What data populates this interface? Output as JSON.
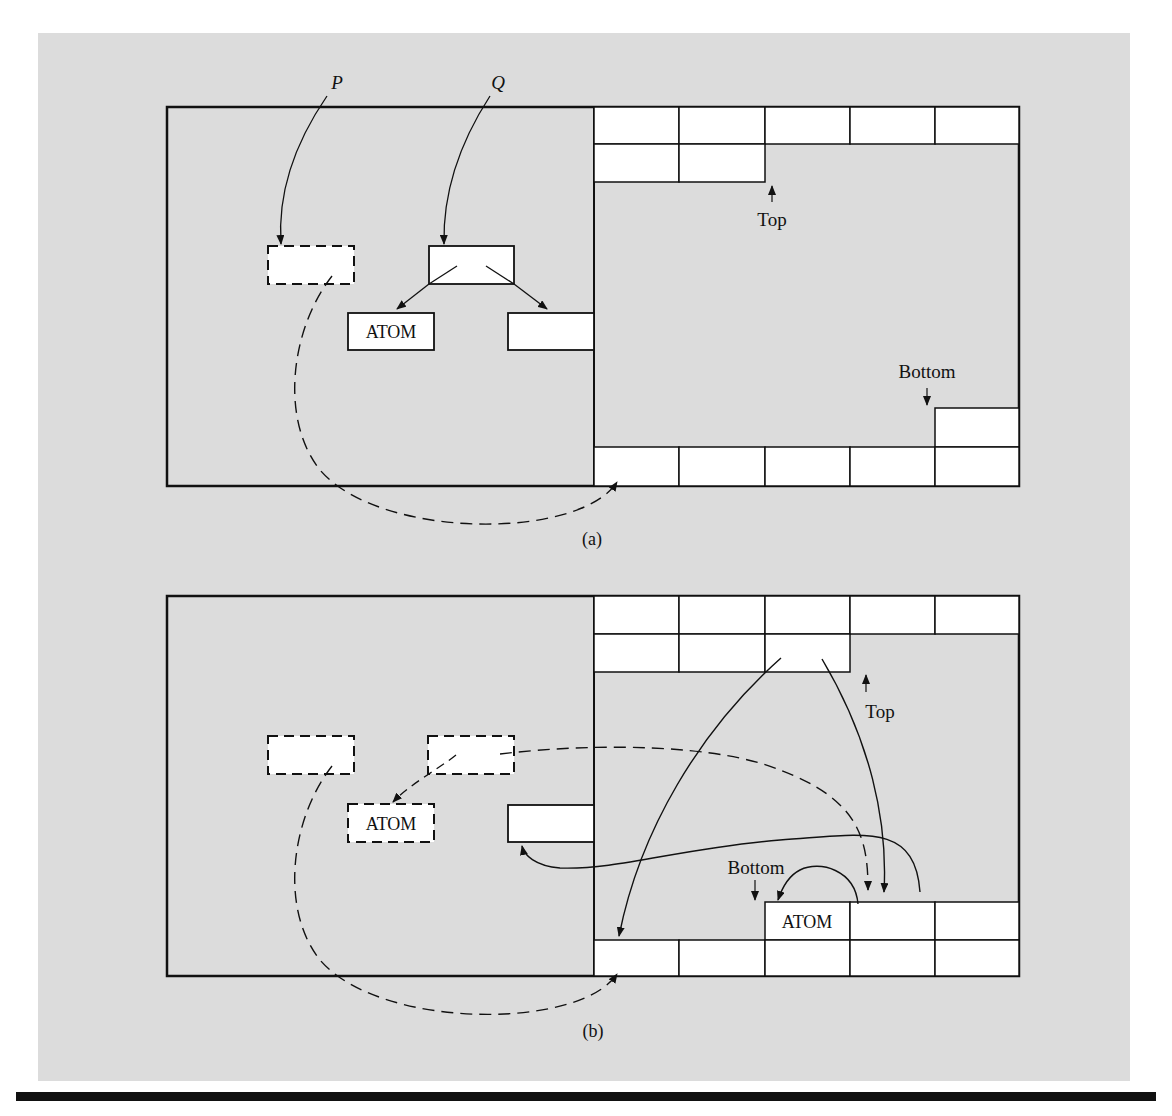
{
  "figure": {
    "panels": [
      {
        "id": "a",
        "caption": "(a)",
        "pointer_labels": [
          "P",
          "Q"
        ],
        "node_label": "ATOM",
        "stack_labels": {
          "top": "Top",
          "bottom": "Bottom"
        }
      },
      {
        "id": "b",
        "caption": "(b)",
        "node_label": "ATOM",
        "stack_node_label": "ATOM",
        "stack_labels": {
          "top": "Top",
          "bottom": "Bottom"
        }
      }
    ],
    "colors": {
      "background": "#ffffff",
      "panel": "#dcdcdc",
      "cell": "#ffffff",
      "stroke": "#111111"
    }
  }
}
